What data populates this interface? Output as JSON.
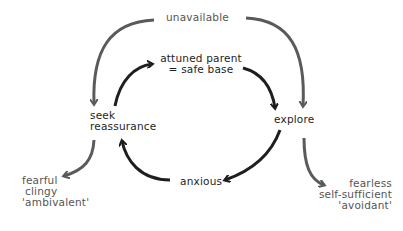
{
  "diagram": {
    "colors": {
      "cycle": "#1e1e1e",
      "outer": "#5a5a5a",
      "background": "#ffffff"
    },
    "nodes": {
      "unavailable": "unavailable",
      "safe_base_line1": "attuned parent",
      "safe_base_line2": "= safe base",
      "seek_line1": "seek",
      "seek_line2": "reassurance",
      "explore": "explore",
      "anxious": "anxious",
      "ambivalent_line1": "fearful",
      "ambivalent_line2": "clingy",
      "ambivalent_line3": "'ambivalent'",
      "avoidant_line1": "fearless",
      "avoidant_line2": "self-sufficient",
      "avoidant_line3": "'avoidant'"
    },
    "edges": [
      {
        "from": "unavailable",
        "to": "seek reassurance",
        "style": "gray"
      },
      {
        "from": "unavailable",
        "to": "explore",
        "style": "gray"
      },
      {
        "from": "seek reassurance",
        "to": "attuned parent = safe base",
        "style": "dark"
      },
      {
        "from": "attuned parent = safe base",
        "to": "explore",
        "style": "dark"
      },
      {
        "from": "explore",
        "to": "anxious",
        "style": "dark"
      },
      {
        "from": "anxious",
        "to": "seek reassurance",
        "style": "dark"
      },
      {
        "from": "seek reassurance",
        "to": "fearful clingy 'ambivalent'",
        "style": "gray"
      },
      {
        "from": "explore",
        "to": "fearless self-sufficient 'avoidant'",
        "style": "gray"
      }
    ]
  }
}
